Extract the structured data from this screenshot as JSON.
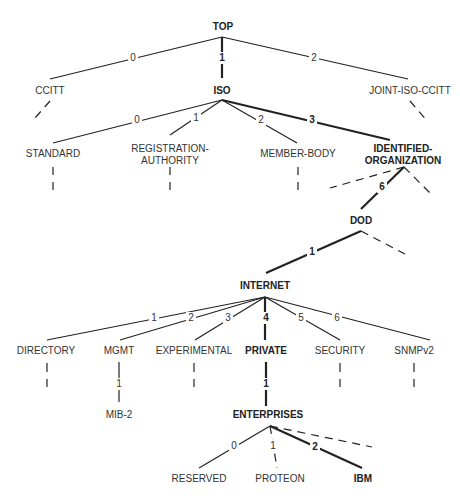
{
  "diagram": {
    "nodes": {
      "top": "TOP",
      "ccitt": "CCITT",
      "iso": "ISO",
      "joint": "JOINT-ISO-CCITT",
      "standard": "STANDARD",
      "regauth_1": "REGISTRATION-",
      "regauth_2": "AUTHORITY",
      "member": "MEMBER-BODY",
      "identorg_1": "IDENTIFIED-",
      "identorg_2": "ORGANIZATION",
      "dod": "DOD",
      "internet": "INTERNET",
      "directory": "DIRECTORY",
      "mgmt": "MGMT",
      "experimental": "EXPERIMENTAL",
      "private": "PRIVATE",
      "security": "SECURITY",
      "snmpv2": "SNMPv2",
      "mib2": "MIB-2",
      "enterprises": "ENTERPRISES",
      "reserved": "RESERVED",
      "proteon": "PROTEON",
      "ibm": "IBM"
    },
    "edges": {
      "top_ccitt": "0",
      "top_iso": "1",
      "top_joint": "2",
      "iso_standard": "0",
      "iso_regauth": "1",
      "iso_member": "2",
      "iso_identorg": "3",
      "identorg_dod": "6",
      "dod_internet": "1",
      "internet_directory": "1",
      "internet_mgmt": "2",
      "internet_experimental": "3",
      "internet_private": "4",
      "internet_security": "5",
      "internet_snmpv2": "6",
      "mgmt_mib2": "1",
      "private_enterprises": "1",
      "enterprises_reserved": "0",
      "enterprises_proteon": "1",
      "enterprises_ibm": "2"
    }
  }
}
